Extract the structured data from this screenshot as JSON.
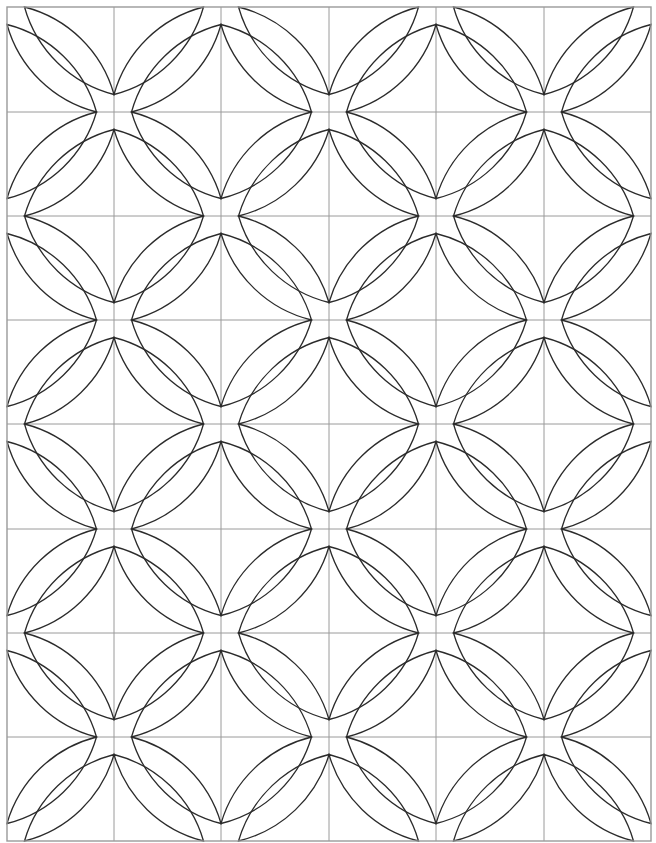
{
  "diagram": {
    "type": "quilt-pattern",
    "columns": 6,
    "rows": 8,
    "column_lines_x": [
      7,
      114,
      221,
      329,
      436,
      544,
      651
    ],
    "row_lines_y": [
      7,
      112,
      216,
      320,
      424,
      529,
      633,
      737,
      841
    ],
    "lens": {
      "endpoint_offset": 17.5,
      "arc_radius": 125
    },
    "colors": {
      "background": "#ffffff",
      "grid": "#9a9a9a",
      "outline": "#2b2b2b"
    }
  }
}
